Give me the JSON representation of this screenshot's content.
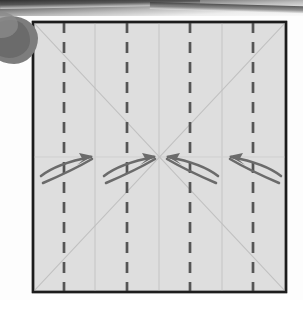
{
  "figure": {
    "type": "origami-instruction"
  },
  "colors": {
    "page_background": "#fdfdfd",
    "paper_fill": "#dedede",
    "paper_border": "#1c1c1c",
    "dash_line": "#555555",
    "faint_crease": "#c4c4c4",
    "diagonal_crease": "#c0c0c0",
    "arrow": "#6b6b6b",
    "scan_artifact": "#6e6e6e"
  },
  "paper": {
    "name": "square-sheet",
    "x": 33,
    "y": 22,
    "width": 253,
    "height": 270,
    "border_width": 2.4
  },
  "fold_lines": [
    {
      "id": "fold-1",
      "x": 64,
      "style": "dashed",
      "meaning": "valley-fold"
    },
    {
      "id": "fold-2",
      "x": 127,
      "style": "dashed",
      "meaning": "valley-fold"
    },
    {
      "id": "fold-3",
      "x": 190,
      "style": "dashed",
      "meaning": "valley-fold"
    },
    {
      "id": "fold-4",
      "x": 253,
      "style": "dashed",
      "meaning": "valley-fold"
    }
  ],
  "existing_creases": [
    {
      "id": "crease-1",
      "x": 95,
      "style": "solid-faint"
    },
    {
      "id": "crease-2",
      "x": 159,
      "style": "solid-faint"
    },
    {
      "id": "crease-3",
      "x": 222,
      "style": "solid-faint"
    }
  ],
  "diagonals": [
    {
      "id": "diagonal-tl-br",
      "from": [
        33,
        22
      ],
      "to": [
        286,
        292
      ]
    },
    {
      "id": "diagonal-bl-tr",
      "from": [
        33,
        292
      ],
      "to": [
        286,
        22
      ]
    }
  ],
  "centre_point": {
    "x": 159.5,
    "y": 157
  },
  "arrows": [
    {
      "id": "arrow-1",
      "direction": "right",
      "from_x": 41,
      "to_x": 93,
      "y": 157,
      "meaning": "fold-left-panel-inward"
    },
    {
      "id": "arrow-2",
      "direction": "right",
      "from_x": 104,
      "to_x": 157,
      "y": 157,
      "meaning": "fold-panel-inward"
    },
    {
      "id": "arrow-3",
      "direction": "left",
      "from_x": 219,
      "to_x": 166,
      "y": 157,
      "meaning": "fold-panel-inward"
    },
    {
      "id": "arrow-4",
      "direction": "left",
      "from_x": 281,
      "to_x": 229,
      "y": 157,
      "meaning": "fold-right-panel-inward"
    }
  ],
  "artifacts": {
    "top_band": "dark scanner smudge across the top edge",
    "left_blob": "dark irregular scan blot at the upper-left margin"
  }
}
